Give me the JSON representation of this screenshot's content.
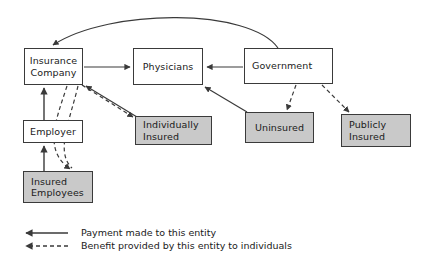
{
  "diagram": {
    "colors": {
      "shaded_fill": "#c9c9c9",
      "plain_fill": "#ffffff",
      "stroke": "#3a3a3a",
      "text": "#1a1a1a",
      "background": "#ffffff"
    },
    "nodes": [
      {
        "id": "insurance-company",
        "lines": [
          "Insurance",
          "Company"
        ],
        "shaded": false,
        "x": 24,
        "y": 48,
        "w": 59,
        "h": 37
      },
      {
        "id": "physicians",
        "lines": [
          "Physicians"
        ],
        "shaded": false,
        "x": 133,
        "y": 48,
        "w": 70,
        "h": 37
      },
      {
        "id": "government",
        "lines": [
          "Government"
        ],
        "shaded": false,
        "x": 244,
        "y": 48,
        "w": 89,
        "h": 36
      },
      {
        "id": "employer",
        "lines": [
          "Employer"
        ],
        "shaded": false,
        "x": 23,
        "y": 120,
        "w": 60,
        "h": 23
      },
      {
        "id": "individually-insured",
        "lines": [
          "Individually",
          "Insured"
        ],
        "shaded": true,
        "x": 135,
        "y": 116,
        "w": 77,
        "h": 29
      },
      {
        "id": "uninsured",
        "lines": [
          "Uninsured"
        ],
        "shaded": true,
        "x": 245,
        "y": 112,
        "w": 69,
        "h": 31
      },
      {
        "id": "publicly-insured",
        "lines": [
          "Publicly",
          "Insured"
        ],
        "shaded": true,
        "x": 341,
        "y": 114,
        "w": 70,
        "h": 33
      },
      {
        "id": "insured-employees",
        "lines": [
          "Insured",
          "Employees"
        ],
        "shaded": true,
        "x": 23,
        "y": 171,
        "w": 70,
        "h": 32
      }
    ],
    "edges": [
      {
        "id": "government-to-insurance-company",
        "style": "solid",
        "from": "government",
        "to": "insurance-company",
        "meaning": "payment"
      },
      {
        "id": "insurance-company-to-physicians",
        "style": "solid",
        "from": "insurance-company",
        "to": "physicians",
        "meaning": "payment"
      },
      {
        "id": "government-to-physicians",
        "style": "solid",
        "from": "government",
        "to": "physicians",
        "meaning": "payment"
      },
      {
        "id": "uninsured-to-physicians",
        "style": "solid",
        "from": "uninsured",
        "to": "physicians",
        "meaning": "payment"
      },
      {
        "id": "individually-insured-to-insurance-company",
        "style": "solid",
        "from": "individually-insured",
        "to": "insurance-company",
        "meaning": "payment"
      },
      {
        "id": "employer-to-insurance-company",
        "style": "solid",
        "from": "employer",
        "to": "insurance-company",
        "meaning": "payment"
      },
      {
        "id": "insured-employees-to-employer",
        "style": "solid",
        "from": "insured-employees",
        "to": "employer",
        "meaning": "payment"
      },
      {
        "id": "insurance-company-to-individually-insured",
        "style": "dashed",
        "from": "insurance-company",
        "to": "individually-insured",
        "meaning": "benefit"
      },
      {
        "id": "insurance-company-to-insured-employees",
        "style": "dashed",
        "from": "insurance-company",
        "to": "insured-employees",
        "meaning": "benefit"
      },
      {
        "id": "government-to-uninsured",
        "style": "dashed",
        "from": "government",
        "to": "uninsured",
        "meaning": "benefit"
      },
      {
        "id": "government-to-publicly-insured",
        "style": "dashed",
        "from": "government",
        "to": "publicly-insured",
        "meaning": "benefit"
      }
    ]
  },
  "legend": {
    "items": [
      {
        "id": "payment",
        "style": "solid",
        "label": "Payment made to this entity"
      },
      {
        "id": "benefit",
        "style": "dashed",
        "label": "Benefit provided by this entity to individuals"
      }
    ]
  }
}
